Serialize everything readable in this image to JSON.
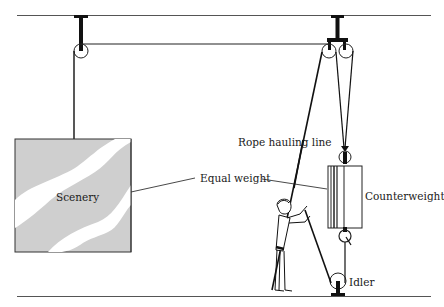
{
  "diagram": {
    "type": "stage counterweight rigging system",
    "labels": {
      "scenery": "Scenery",
      "equal_weight": "Equal weight",
      "rope_hauling_line": "Rope hauling line",
      "counterweight": "Counterweight",
      "idler": "Idler"
    },
    "colors": {
      "line": "#1a1a1a",
      "scenery_fill": "#cfcfcf",
      "scenery_highlight": "#ffffff",
      "background": "#ffffff"
    },
    "components": [
      "ceiling-beam",
      "loft-block",
      "head-block",
      "scenery-batten",
      "arbor",
      "operator",
      "idler-pulley",
      "stage-floor"
    ]
  }
}
